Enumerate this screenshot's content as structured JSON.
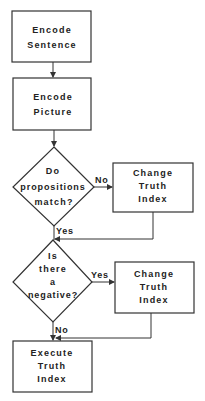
{
  "diagram": {
    "type": "flowchart",
    "nodes": [
      {
        "id": "encode_sentence",
        "shape": "rect",
        "lines": [
          "Encode",
          "Sentence"
        ]
      },
      {
        "id": "encode_picture",
        "shape": "rect",
        "lines": [
          "Encode",
          "Picture"
        ]
      },
      {
        "id": "propositions_match",
        "shape": "diamond",
        "lines": [
          "Do",
          "propositions",
          "match?"
        ]
      },
      {
        "id": "change_truth_1",
        "shape": "rect",
        "lines": [
          "Change",
          "Truth",
          "Index"
        ]
      },
      {
        "id": "is_negative",
        "shape": "diamond",
        "lines": [
          "Is",
          "there",
          "a",
          "negative?"
        ]
      },
      {
        "id": "change_truth_2",
        "shape": "rect",
        "lines": [
          "Change",
          "Truth",
          "Index"
        ]
      },
      {
        "id": "execute_truth",
        "shape": "rect",
        "lines": [
          "Execute",
          "Truth",
          "Index"
        ]
      }
    ],
    "edges": [
      {
        "from": "encode_sentence",
        "to": "encode_picture",
        "label": ""
      },
      {
        "from": "encode_picture",
        "to": "propositions_match",
        "label": ""
      },
      {
        "from": "propositions_match",
        "to": "change_truth_1",
        "label": "No"
      },
      {
        "from": "propositions_match",
        "to": "is_negative",
        "label": "Yes"
      },
      {
        "from": "change_truth_1",
        "to": "is_negative",
        "label": ""
      },
      {
        "from": "is_negative",
        "to": "change_truth_2",
        "label": "Yes"
      },
      {
        "from": "is_negative",
        "to": "execute_truth",
        "label": "No"
      },
      {
        "from": "change_truth_2",
        "to": "execute_truth",
        "label": ""
      }
    ]
  }
}
